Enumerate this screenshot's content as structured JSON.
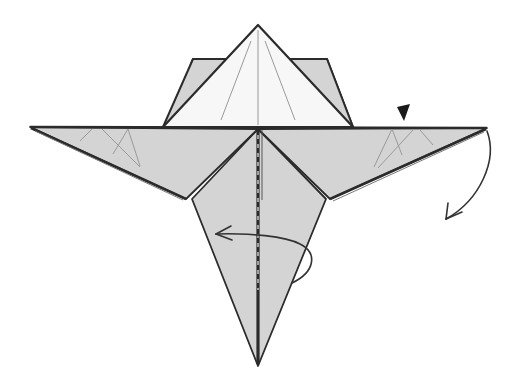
{
  "diagram": {
    "type": "origami-folding-step",
    "colors": {
      "background": "#ffffff",
      "paper_colored": "#d4d4d4",
      "paper_white": "#f7f7f7",
      "outline": "#2b2b2b",
      "crease": "#8a8a8a",
      "arrow": "#333333"
    },
    "symbols": [
      {
        "name": "push-arrow",
        "meaning": "press / open point",
        "glyph": "▼"
      },
      {
        "name": "fold-arrow",
        "meaning": "fold wing tip downward"
      },
      {
        "name": "turn-over-arrow",
        "meaning": "loop arrow: fold / turn to the left"
      }
    ]
  }
}
